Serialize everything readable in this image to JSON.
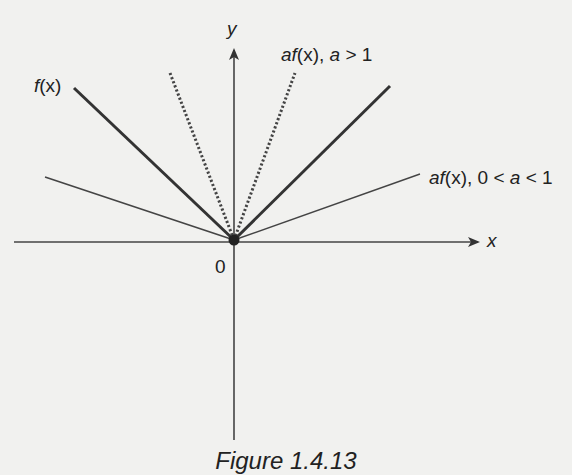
{
  "diagram": {
    "axes": {
      "x_label": "x",
      "y_label": "y",
      "origin_label": "0"
    },
    "labels": {
      "f": {
        "fn": "f",
        "arg": "(x)"
      },
      "a_gt_1": {
        "a": "a",
        "fn": "f",
        "arg": "(x)",
        "cond": ", ",
        "cond_a": "a",
        "cond_rest": " > 1"
      },
      "a_between": {
        "a": "a",
        "fn": "f",
        "arg": "(x)",
        "cond": ", 0 < ",
        "cond_a": "a",
        "cond_rest": " < 1"
      }
    },
    "caption": "Figure 1.4.13"
  },
  "colors": {
    "background": "#f1f1ef",
    "ink": "#333333"
  }
}
